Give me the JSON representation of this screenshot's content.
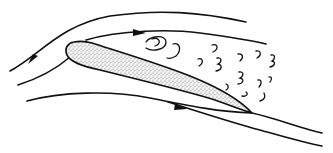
{
  "diagram": {
    "subject": "Airfoil at high angle of attack with separated flow (stall)",
    "elements": {
      "streamlines": [
        {
          "id": "upper-outer",
          "has_arrow": true,
          "arrow_position": "left"
        },
        {
          "id": "upper-inner",
          "has_arrow": true,
          "arrow_position": "middle"
        },
        {
          "id": "lower-inner",
          "has_arrow": true,
          "arrow_position": "middle"
        },
        {
          "id": "lower-outer",
          "has_arrow": false
        }
      ],
      "airfoil": {
        "fill": "stippled",
        "orientation": "nose-up"
      },
      "wake": {
        "type": "turbulent eddies",
        "count": 14
      }
    },
    "colors": {
      "ink": "#111111",
      "stipple": "#888888",
      "background": "#ffffff"
    }
  }
}
